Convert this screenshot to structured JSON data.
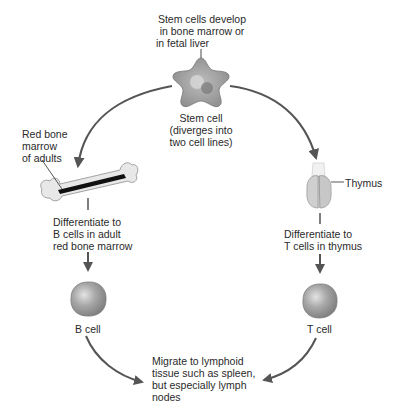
{
  "diagram": {
    "stem_origin": {
      "lines": [
        "Stem cells develop",
        "in bone marrow or",
        "in fetal liver"
      ]
    },
    "stem_cell": {
      "lines": [
        "Stem cell",
        "(diverges into",
        "two cell lines)"
      ]
    },
    "bone_marrow": {
      "lines": [
        "Red bone",
        "marrow",
        "of adults"
      ]
    },
    "thymus": {
      "label": "Thymus"
    },
    "b_differentiate": {
      "lines": [
        "Differentiate to",
        "B cells in adult",
        "red bone marrow"
      ]
    },
    "t_differentiate": {
      "lines": [
        "Differentiate to",
        "T cells in thymus"
      ]
    },
    "b_cell": {
      "label": "B cell"
    },
    "t_cell": {
      "label": "T cell"
    },
    "migrate": {
      "lines": [
        "Migrate to lymphoid",
        "tissue such as spleen,",
        "but especially lymph",
        "nodes"
      ]
    },
    "colors": {
      "arrow": "#555555",
      "cell_fill": "#a9a9a9",
      "cell_dark": "#6e6e6e",
      "bone_fill": "#e9e9e9",
      "marrow": "#111111",
      "thymus_fill": "#cfcfcf"
    }
  }
}
